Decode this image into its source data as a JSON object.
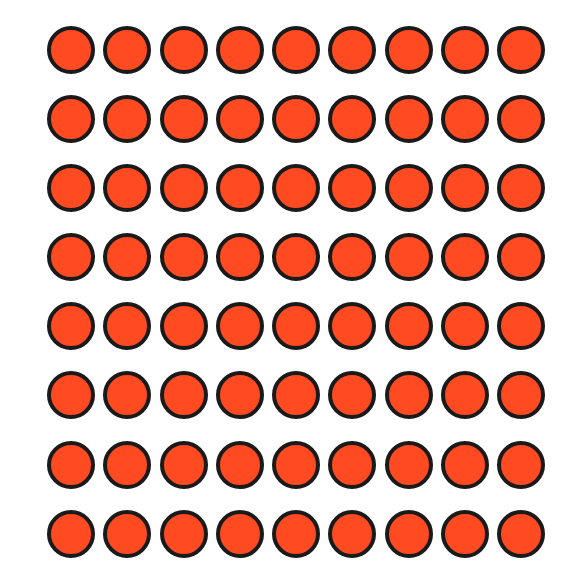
{
  "figure": {
    "rows": 8,
    "columns": 9,
    "total_count": 72,
    "shape": "circle",
    "fill_color": "#ff4a22",
    "stroke_color": "#1a1a1a",
    "background_color": "#ffffff"
  }
}
